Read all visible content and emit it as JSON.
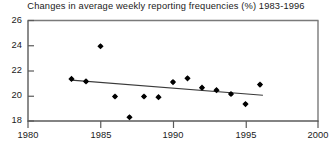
{
  "chart_data": {
    "type": "scatter",
    "title": "Changes in average weekly reporting frequencies (%) 1983-1996",
    "xlabel": "",
    "ylabel": "",
    "xlim": [
      1980,
      2000
    ],
    "ylim": [
      18,
      26
    ],
    "xticks": [
      1980,
      1985,
      1990,
      1995,
      2000
    ],
    "yticks": [
      18,
      20,
      22,
      24,
      26
    ],
    "grid": false,
    "legend": "none",
    "marker": "filled-diamond",
    "marker_color": "#000000",
    "series": [
      {
        "name": "Average weekly reporting frequency",
        "x": [
          1983,
          1984,
          1985,
          1986,
          1987,
          1988,
          1989,
          1990,
          1991,
          1992,
          1993,
          1994,
          1995,
          1996
        ],
        "values": [
          21.35,
          21.15,
          23.95,
          19.95,
          18.3,
          19.95,
          19.9,
          21.1,
          21.4,
          20.65,
          20.45,
          20.15,
          19.35,
          20.9
        ]
      }
    ],
    "trendline": {
      "name": "linear-trend",
      "x": [
        1983,
        1996.2
      ],
      "values": [
        21.25,
        20.05
      ],
      "color": "#3a3a3a"
    }
  },
  "axes": {
    "x_tick_labels": [
      "1980",
      "1985",
      "1990",
      "1995",
      "2000"
    ],
    "y_tick_labels": [
      "26",
      "24",
      "22",
      "20",
      "18"
    ],
    "frame_color": "#6b6b6b"
  }
}
